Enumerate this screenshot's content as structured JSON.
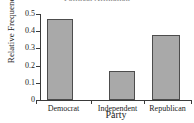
{
  "chart_data": {
    "type": "bar",
    "title": "Political Affiliation",
    "xlabel": "Party",
    "ylabel": "Relative Frequency",
    "categories": [
      "Democrat",
      "Independent",
      "Republican"
    ],
    "values": [
      0.47,
      0.17,
      0.38
    ],
    "ylim": [
      0,
      0.5
    ],
    "yticks": [
      "0",
      "0.1",
      "0.2",
      "0.3",
      "0.4",
      "0.5"
    ],
    "ytick_values": [
      0,
      0.1,
      0.2,
      0.3,
      0.4,
      0.5
    ],
    "grid": false,
    "legend": null,
    "bar_color": "#a9a9a9",
    "bar_edge_color": "#4d4d4d",
    "axis_color": "#3a3a3a",
    "background": "#ffffff"
  }
}
